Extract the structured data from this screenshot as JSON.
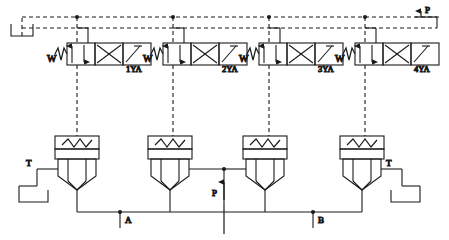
{
  "diagram": {
    "type": "hydraulic-schematic",
    "stroke_color": "#1a1a1a",
    "background_color": "#ffffff",
    "dash_pattern": "4,3"
  },
  "ports": {
    "pressure_top": "P",
    "pressure_bottom": "P",
    "tank_left": "T",
    "tank_right": "T",
    "work_a": "A",
    "work_b": "B"
  },
  "solenoid_valves": [
    {
      "id": "v1",
      "label": "1YA",
      "spring_label": "W",
      "x": 62,
      "y": 42
    },
    {
      "id": "v2",
      "label": "2YA",
      "spring_label": "W",
      "x": 158,
      "y": 42
    },
    {
      "id": "v3",
      "label": "3YA",
      "spring_label": "W",
      "x": 254,
      "y": 42
    },
    {
      "id": "v4",
      "label": "4YA",
      "spring_label": "W",
      "x": 350,
      "y": 42
    }
  ],
  "cartridge_valves": [
    {
      "id": "c1",
      "x": 55,
      "y": 134
    },
    {
      "id": "c2",
      "x": 148,
      "y": 134
    },
    {
      "id": "c3",
      "x": 243,
      "y": 134
    },
    {
      "id": "c4",
      "x": 340,
      "y": 134
    }
  ],
  "tanks": [
    {
      "id": "tank-top-left",
      "x": 10,
      "y": 22
    },
    {
      "id": "tank-bottom-left",
      "x": 18,
      "y": 186
    },
    {
      "id": "tank-bottom-right",
      "x": 404,
      "y": 186
    }
  ],
  "pilot_lines": {
    "top_rail_y": 17,
    "second_rail_y": 28,
    "junction_dots": [
      77,
      173,
      269,
      365
    ]
  }
}
